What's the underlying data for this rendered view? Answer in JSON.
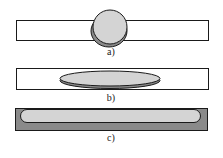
{
  "figure": {
    "panels": [
      {
        "label": "a)",
        "shape": "sphere-on-plate",
        "caption_x": 100,
        "caption_y": 47
      },
      {
        "label": "b)",
        "shape": "lens-on-plate",
        "caption_x": 100,
        "caption_y": 93
      },
      {
        "label": "c)",
        "shape": "film-covering-plate",
        "caption_x": 100,
        "caption_y": 133
      }
    ],
    "colors": {
      "plate_fill": "#ffffff",
      "outline": "#1a1a1a",
      "light_gray": "#d4d4d4",
      "dark_gray": "#8a8a8a"
    }
  }
}
